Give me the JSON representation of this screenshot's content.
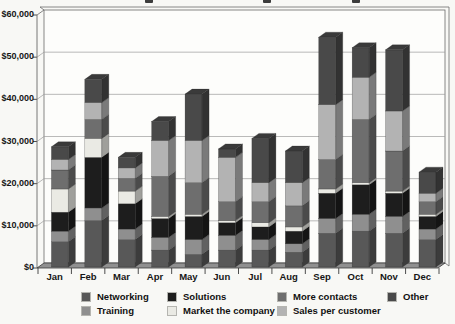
{
  "chart_data": {
    "type": "bar",
    "stacked": true,
    "projection": "3d",
    "title_cropped": true,
    "categories": [
      "Jan",
      "Feb",
      "Mar",
      "Apr",
      "May",
      "Jun",
      "Jul",
      "Aug",
      "Sep",
      "Oct",
      "Nov",
      "Dec"
    ],
    "series": [
      {
        "name": "Networking",
        "color": "#585858",
        "values": [
          6000,
          11000,
          6500,
          4000,
          3000,
          4000,
          4000,
          3500,
          8000,
          8500,
          8000,
          6500
        ]
      },
      {
        "name": "Training",
        "color": "#8f8f8f",
        "values": [
          2500,
          3000,
          2500,
          3000,
          3500,
          3500,
          2500,
          2000,
          3500,
          4000,
          4000,
          2500
        ]
      },
      {
        "name": "Solutions",
        "color": "#1d1d1d",
        "values": [
          4500,
          12000,
          6000,
          4500,
          5500,
          3000,
          3000,
          3000,
          6000,
          7000,
          5500,
          3000
        ]
      },
      {
        "name": "Market the company",
        "color": "#eaeae4",
        "values": [
          5500,
          4500,
          3000,
          500,
          500,
          500,
          1000,
          1000,
          1000,
          500,
          500,
          500
        ]
      },
      {
        "name": "More contacts",
        "color": "#6e6e6e",
        "values": [
          4500,
          4500,
          3000,
          9500,
          7500,
          4500,
          5000,
          5000,
          7000,
          15000,
          9500,
          3000
        ]
      },
      {
        "name": "Sales per customer",
        "color": "#b3b3b3",
        "values": [
          2500,
          4000,
          2500,
          8500,
          10000,
          10500,
          4500,
          5500,
          13000,
          10000,
          9500,
          2000
        ]
      },
      {
        "name": "Other",
        "color": "#494949",
        "values": [
          3000,
          5500,
          2500,
          4500,
          11000,
          2000,
          10500,
          7500,
          16000,
          7000,
          14500,
          5000
        ]
      }
    ],
    "y_axis": {
      "min": 0,
      "max": 60000,
      "tick_interval": 10000,
      "tick_labels": [
        "$60,000",
        "$50,000",
        "$40,000",
        "$30,000",
        "$20,000",
        "$10,000",
        "$0"
      ]
    },
    "grid": true,
    "legend_position": "bottom",
    "legend_columns": [
      [
        "Networking",
        "Training"
      ],
      [
        "Solutions",
        "Market the company"
      ],
      [
        "More contacts",
        "Sales per customer"
      ],
      [
        "Other"
      ]
    ],
    "structure_colors": {
      "floor": "#909090",
      "wall_fill": "#fdfdfb",
      "wall_stroke": "#6a6a6a",
      "gridline": "#9c9c9c",
      "text": "#161616"
    }
  }
}
